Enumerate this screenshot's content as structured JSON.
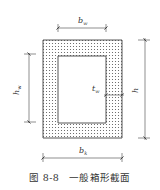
{
  "figure": {
    "caption": "图 8-8   一般箱形截面",
    "caption_number": "图 8-8",
    "caption_title": "一般箱形截面",
    "type": "box-section-cross-section",
    "fill_pattern": "dotted-hatch",
    "colors": {
      "line": "#444444",
      "hatch": "#555555",
      "background": "#ffffff"
    }
  },
  "labels": {
    "top_width": {
      "main": "b",
      "sub": "w"
    },
    "bottom_width": {
      "main": "b",
      "sub": "k"
    },
    "left_height": {
      "main": "h",
      "sub": "w"
    },
    "right_height": {
      "main": "h",
      "sub": ""
    },
    "wall_thickness": {
      "main": "t",
      "sub": "w"
    }
  }
}
